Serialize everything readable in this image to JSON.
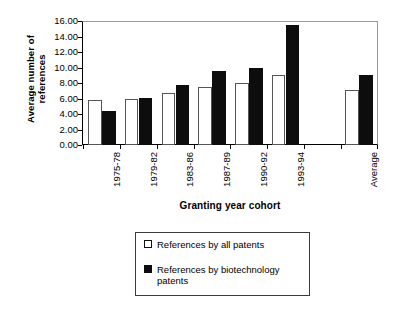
{
  "chart_data": {
    "type": "bar",
    "title": "",
    "xlabel": "Granting year cohort",
    "ylabel": "Average number of references",
    "ylim": [
      0,
      16
    ],
    "ytick_labels": [
      "16.00",
      "14.00",
      "12.00",
      "10.00",
      "8.00",
      "6.00",
      "4.00",
      "2.00",
      "0.00"
    ],
    "ytick_values": [
      16,
      14,
      12,
      10,
      8,
      6,
      4,
      2,
      0
    ],
    "grid": false,
    "legend_position": "below-plot",
    "categories": [
      "1975-78",
      "1979-82",
      "1983-86",
      "1987-89",
      "1990-92",
      "1993-94",
      "",
      "Average"
    ],
    "series": [
      {
        "name": "References by all patents",
        "color": "#ffffff",
        "values": [
          5.8,
          5.9,
          6.7,
          7.5,
          8.0,
          9.0,
          null,
          7.1
        ]
      },
      {
        "name": "References by biotechnology patents",
        "color": "#0d0d0d",
        "values": [
          4.4,
          6.1,
          7.7,
          9.5,
          10.0,
          15.5,
          null,
          9.0
        ]
      }
    ]
  },
  "legend": {
    "items": [
      {
        "label": "References by all patents",
        "swatch": "light"
      },
      {
        "label": "References by biotechnology patents",
        "swatch": "dark"
      }
    ]
  }
}
